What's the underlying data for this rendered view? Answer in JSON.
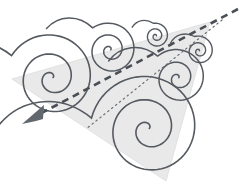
{
  "figure": {
    "title": "Vorticity vectors on an inclined plane",
    "canvas": {
      "width": 244,
      "height": 190,
      "background": "#ffffff"
    }
  },
  "colors": {
    "plane_fill": "#e9e9e9",
    "plane_stroke": "#e2e2e2",
    "spiral_stroke": "#555a60",
    "dashed_line": "#4a4f55",
    "dotted_line": "#6b7077",
    "arrowhead_fill": "#63686e"
  },
  "plane": {
    "name": "triangular-plane",
    "points": "12,79 210,22 166,181",
    "fill": "#e9e9e9",
    "opacity": 1
  },
  "dashed_arrow": {
    "name": "dashed-vorticity-arrow",
    "label": "dashed arrow",
    "x1": 238,
    "y1": 9,
    "x2": 36,
    "y2": 116,
    "stroke": "#4a4f55",
    "stroke_width": 2.6,
    "dash_pattern": "7,5",
    "arrowhead": {
      "points": "22,124 44,105 43,119 36,121",
      "fill": "#63686e"
    }
  },
  "dotted_line": {
    "name": "dotted-reference-line",
    "label": "dotted line",
    "x1": 222,
    "y1": 20,
    "x2": 86,
    "y2": 129,
    "stroke": "#6b7077",
    "stroke_width": 1.2,
    "dash_pattern": "1.5,3.5"
  },
  "spirals": [
    {
      "name": "spiral-large-left",
      "cx": 52,
      "cy": 78,
      "scale": 1.0,
      "rotation": -25,
      "turns": 2.35,
      "stroke_width": 1.6
    },
    {
      "name": "spiral-medium-upper-left",
      "cx": 110,
      "cy": 50,
      "scale": 0.62,
      "rotation": -20,
      "turns": 2.3,
      "stroke_width": 1.5
    },
    {
      "name": "spiral-small-top",
      "cx": 156,
      "cy": 36,
      "scale": 0.3,
      "rotation": -30,
      "turns": 2.2,
      "stroke_width": 1.4
    },
    {
      "name": "spiral-small-upper-right",
      "cx": 199,
      "cy": 51,
      "scale": 0.35,
      "rotation": -35,
      "turns": 2.2,
      "stroke_width": 1.4
    },
    {
      "name": "spiral-medium-right",
      "cx": 178,
      "cy": 78,
      "scale": 0.66,
      "rotation": -25,
      "turns": 2.3,
      "stroke_width": 1.5
    },
    {
      "name": "spiral-largest-bottom",
      "cx": 148,
      "cy": 129,
      "scale": 1.22,
      "rotation": -25,
      "turns": 2.4,
      "stroke_width": 1.6
    }
  ]
}
